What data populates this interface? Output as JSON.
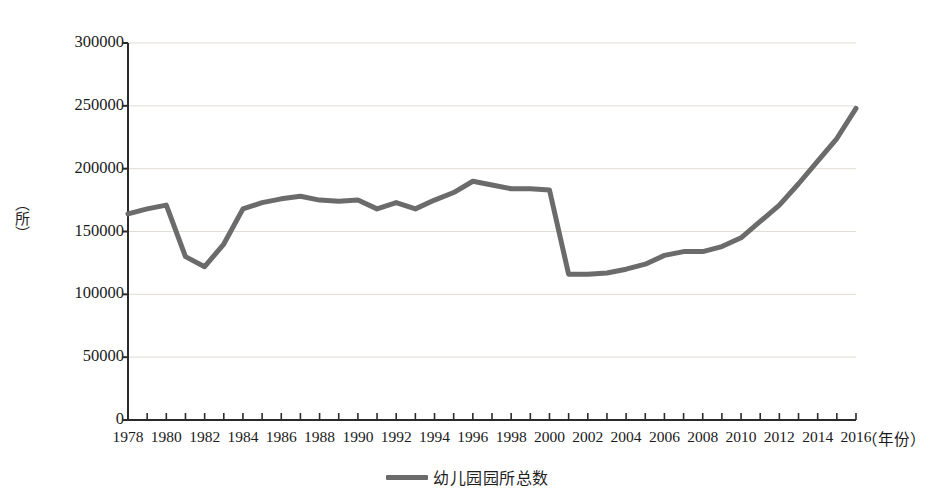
{
  "chart_data": {
    "type": "line",
    "title": "",
    "xlabel": "（年份）",
    "ylabel": "（所）",
    "xlim": [
      1978,
      2016
    ],
    "ylim": [
      0,
      300000
    ],
    "grid": true,
    "legend_position": "bottom-center",
    "y_ticks": [
      0,
      50000,
      100000,
      150000,
      200000,
      250000,
      300000
    ],
    "y_tick_labels": [
      "0",
      "50000",
      "100000",
      "150000",
      "200000",
      "250000",
      "300000"
    ],
    "x_tick_labels": [
      "1978",
      "1980",
      "1982",
      "1984",
      "1986",
      "1988",
      "1990",
      "1992",
      "1994",
      "1996",
      "1998",
      "2000",
      "2002",
      "2004",
      "2006",
      "2008",
      "2010",
      "2012",
      "2014",
      "2016"
    ],
    "x_tick_values": [
      1978,
      1980,
      1982,
      1984,
      1986,
      1988,
      1990,
      1992,
      1994,
      1996,
      1998,
      2000,
      2002,
      2004,
      2006,
      2008,
      2010,
      2012,
      2014,
      2016
    ],
    "series": [
      {
        "name": "幼儿园园所总数",
        "color": "#6b6b6b",
        "line_width": 5,
        "x": [
          1978,
          1979,
          1980,
          1981,
          1982,
          1983,
          1984,
          1985,
          1986,
          1987,
          1988,
          1989,
          1990,
          1991,
          1992,
          1993,
          1994,
          1995,
          1996,
          1997,
          1998,
          1999,
          2000,
          2001,
          2002,
          2003,
          2004,
          2005,
          2006,
          2007,
          2008,
          2009,
          2010,
          2011,
          2012,
          2013,
          2014,
          2015,
          2016
        ],
        "values": [
          164000,
          168000,
          171000,
          130000,
          122000,
          140000,
          168000,
          173000,
          176000,
          178000,
          175000,
          174000,
          175000,
          168000,
          173000,
          168000,
          175000,
          181000,
          190000,
          187000,
          184000,
          184000,
          183000,
          116000,
          116000,
          117000,
          120000,
          124000,
          131000,
          134000,
          134000,
          138000,
          145000,
          158000,
          171000,
          188000,
          206000,
          224000,
          248000
        ]
      }
    ]
  },
  "legend": {
    "entries": [
      {
        "label": "幼儿园园所总数",
        "color": "#6b6b6b"
      }
    ]
  },
  "axes": {
    "y_axis_title": "（所）",
    "x_axis_title": "（年份）"
  }
}
